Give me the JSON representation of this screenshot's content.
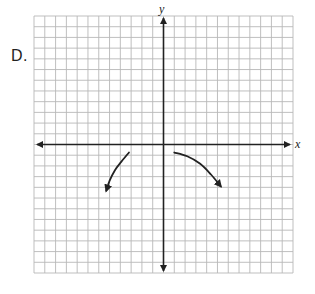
{
  "option_label": "D.",
  "axes": {
    "x_label": "x",
    "y_label": "y"
  },
  "colors": {
    "grid": "#b8b8b8",
    "axis": "#222222",
    "curve": "#222222",
    "background": "#ffffff"
  },
  "chart_data": {
    "type": "line",
    "title": "",
    "xlabel": "x",
    "ylabel": "y",
    "xlim": [
      -12,
      12
    ],
    "ylim": [
      -12,
      12
    ],
    "grid": true,
    "grid_step": 1,
    "tick_labels": false,
    "legend": null,
    "axes_arrows": true,
    "series": [
      {
        "name": "left branch",
        "x": [
          -3.2,
          -3.9,
          -4.5,
          -5.0,
          -5.3
        ],
        "y": [
          -0.75,
          -1.6,
          -2.4,
          -3.4,
          -4.3
        ],
        "end_arrow": true
      },
      {
        "name": "right branch",
        "x": [
          1.0,
          2.2,
          3.4,
          4.4,
          5.3
        ],
        "y": [
          -0.75,
          -1.1,
          -1.8,
          -2.8,
          -3.9
        ],
        "end_arrow": true
      }
    ]
  }
}
